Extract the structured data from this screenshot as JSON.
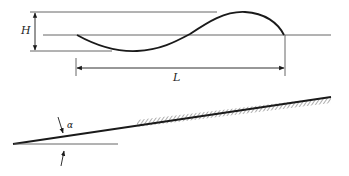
{
  "figure": {
    "wave_panel": {
      "height_label": "H",
      "length_label": "L",
      "reference_lines": [
        "crest-level",
        "still-water-level",
        "trough-level"
      ]
    },
    "slope_panel": {
      "angle_label": "α",
      "ground": "hatched sloping bed"
    },
    "colors": {
      "line": "#1a1a1a",
      "thin_line": "#555555",
      "background": "#ffffff"
    }
  }
}
